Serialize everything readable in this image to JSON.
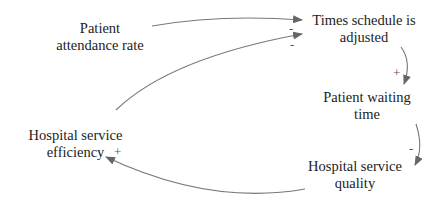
{
  "diagram": {
    "type": "causal-loop",
    "colors": {
      "text": "#222222",
      "arrow": "#666666",
      "background": "#ffffff"
    },
    "nodes": {
      "attendance": {
        "line1": "Patient",
        "line2": "attendance rate"
      },
      "schedule": {
        "line1": "Times schedule is",
        "line2": "adjusted"
      },
      "waiting": {
        "line1": "Patient waiting",
        "line2": "time"
      },
      "quality": {
        "line1": "Hospital service",
        "line2": "quality"
      },
      "efficiency": {
        "line1": "Hospital service",
        "line2": "efficiency"
      }
    },
    "links": [
      {
        "from": "Patient attendance rate",
        "to": "Times schedule is adjusted",
        "polarity": "-"
      },
      {
        "from": "Hospital service efficiency",
        "to": "Times schedule is adjusted",
        "polarity": "-"
      },
      {
        "from": "Times schedule is adjusted",
        "to": "Patient waiting time",
        "polarity": "+"
      },
      {
        "from": "Patient waiting time",
        "to": "Hospital service quality",
        "polarity": "-"
      },
      {
        "from": "Hospital service quality",
        "to": "Hospital service efficiency",
        "polarity": "+"
      }
    ],
    "signs": {
      "attendance_to_schedule": "-",
      "efficiency_to_schedule": "-",
      "schedule_to_waiting": "+",
      "waiting_to_quality": "-",
      "quality_to_efficiency": "+"
    }
  }
}
